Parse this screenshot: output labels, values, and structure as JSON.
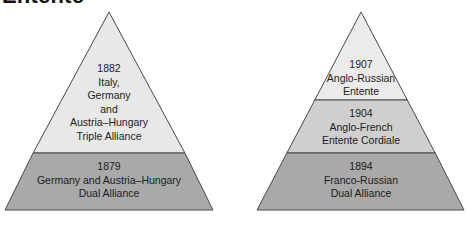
{
  "title": "Entente",
  "colors": {
    "outline": "#4a4a4a",
    "light_band": "#ebebeb",
    "mid_band": "#cfcfcf",
    "dark_band": "#a9a9a9"
  },
  "left_pyramid": {
    "name": "Triple Alliance pyramid",
    "tiers": [
      {
        "position": "top",
        "lines": [
          "1882",
          "Italy,",
          "Germany",
          "and",
          "Austria–Hungary",
          "Triple Alliance"
        ]
      },
      {
        "position": "bottom",
        "lines": [
          "1879",
          "Germany and Austria–Hungary",
          "Dual Alliance"
        ]
      }
    ]
  },
  "right_pyramid": {
    "name": "Triple Entente pyramid",
    "tiers": [
      {
        "position": "top",
        "lines": [
          "1907",
          "Anglo-Russian",
          "Entente"
        ]
      },
      {
        "position": "middle",
        "lines": [
          "1904",
          "Anglo-French",
          "Entente Cordiale"
        ]
      },
      {
        "position": "bottom",
        "lines": [
          "1894",
          "Franco-Russian",
          "Dual Alliance"
        ]
      }
    ]
  }
}
